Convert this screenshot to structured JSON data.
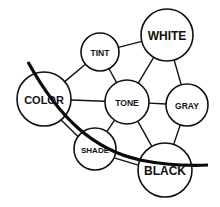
{
  "diagram": {
    "type": "concept-network",
    "nodes": [
      {
        "id": "tint",
        "label": "TINT"
      },
      {
        "id": "white",
        "label": "WHITE"
      },
      {
        "id": "color",
        "label": "COLOR"
      },
      {
        "id": "tone",
        "label": "TONE"
      },
      {
        "id": "gray",
        "label": "GRAY"
      },
      {
        "id": "shade",
        "label": "SHADE"
      },
      {
        "id": "black",
        "label": "BLACK"
      }
    ],
    "edges": [
      {
        "from": "tint",
        "to": "white",
        "style": "single"
      },
      {
        "from": "tint",
        "to": "color",
        "style": "single"
      },
      {
        "from": "tint",
        "to": "tone",
        "style": "single"
      },
      {
        "from": "white",
        "to": "tone",
        "style": "single"
      },
      {
        "from": "white",
        "to": "gray",
        "style": "single"
      },
      {
        "from": "color",
        "to": "tone",
        "style": "single"
      },
      {
        "from": "tone",
        "to": "gray",
        "style": "single"
      },
      {
        "from": "tone",
        "to": "shade",
        "style": "single"
      },
      {
        "from": "tone",
        "to": "black",
        "style": "single"
      },
      {
        "from": "gray",
        "to": "black",
        "style": "single"
      },
      {
        "from": "color",
        "to": "shade",
        "style": "double"
      },
      {
        "from": "shade",
        "to": "black",
        "style": "double"
      }
    ],
    "boundary_curve": {
      "description": "thick dividing arc from upper-left crossing COLOR, SHADE and BLACK",
      "color": "#0a0a0a"
    },
    "colors": {
      "stroke": "#111111",
      "background": "#ffffff"
    }
  }
}
